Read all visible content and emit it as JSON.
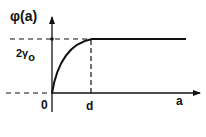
{
  "diagram": {
    "y_axis_label": "φ(a)",
    "x_axis_label": "a",
    "origin_label": "0",
    "d_label": "d",
    "plateau_label_main": "2γ",
    "plateau_label_sub": "o",
    "curve": "rises from origin concavely to plateau at a = d, then constant"
  }
}
